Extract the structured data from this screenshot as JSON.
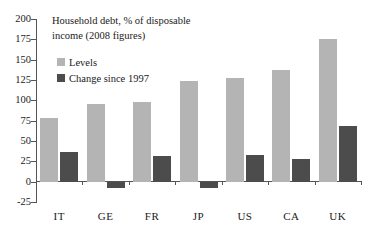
{
  "chart_data": {
    "type": "bar",
    "title": "Household debt, % of disposable income (2008 figures)",
    "title_line1": "Household debt, % of disposable",
    "title_line2": "income (2008 figures)",
    "xlabel": "",
    "ylabel": "",
    "ylim": [
      -25,
      200
    ],
    "yticks": [
      200,
      175,
      150,
      125,
      100,
      75,
      50,
      25,
      0,
      -25
    ],
    "ytick_labels": [
      "200",
      "175",
      "150",
      "125",
      "100",
      "75",
      "50",
      "25",
      "0",
      "-25"
    ],
    "grid": false,
    "legend_position": "upper-left-inside",
    "categories": [
      "IT",
      "GE",
      "FR",
      "JP",
      "US",
      "CA",
      "UK"
    ],
    "series": [
      {
        "name": "Levels",
        "color": "#b4b4b4",
        "values": [
          78,
          96,
          98,
          124,
          127,
          137,
          175
        ]
      },
      {
        "name": "Change since 1997",
        "color": "#4c4c4c",
        "values": [
          36,
          -8,
          31,
          -8,
          33,
          28,
          68
        ]
      }
    ]
  },
  "legend": {
    "items": [
      {
        "label": "Levels",
        "swatch": "levels-swatch"
      },
      {
        "label": "Change since 1997",
        "swatch": "change-swatch"
      }
    ]
  },
  "colors": {
    "levels": "#b4b4b4",
    "change": "#4c4c4c",
    "axis": "#555555",
    "text": "#1a1a1a",
    "background": "#ffffff"
  }
}
